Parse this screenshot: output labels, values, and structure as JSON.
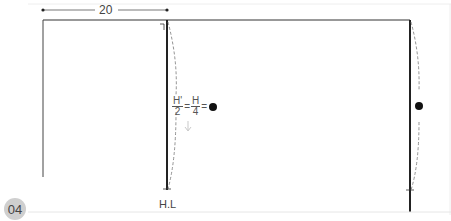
{
  "diagram": {
    "step_badge": "04",
    "dimension_label": "20",
    "formula": {
      "left_num": "H'",
      "left_den": "2",
      "eq1": "=",
      "right_num": "H",
      "right_den": "4",
      "eq2": "="
    },
    "bottom_label": "H.L",
    "colors": {
      "line": "#333333",
      "dashed": "#777777",
      "badge": "#cfcfcf",
      "dot": "#111111"
    }
  }
}
